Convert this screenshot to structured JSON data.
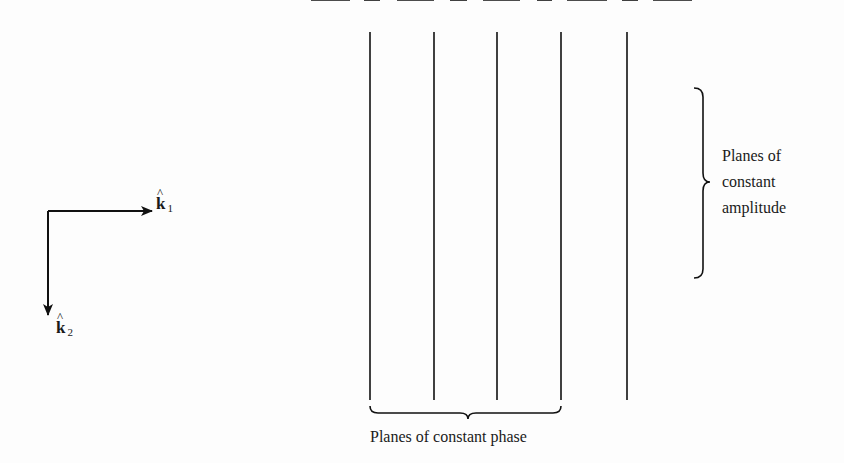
{
  "diagram": {
    "type": "wave-planes",
    "colors": {
      "ink": "#111111",
      "background": "#fdfdfd"
    },
    "unit_vectors": [
      {
        "id": "k1",
        "symbol": "k",
        "hat": "^",
        "subscript": "1",
        "direction": "right"
      },
      {
        "id": "k2",
        "symbol": "k",
        "hat": "^",
        "subscript": "2",
        "direction": "down"
      }
    ],
    "grid": {
      "vertical_lines": 5,
      "horizontal_dashed_rows": 5
    },
    "labels": {
      "amplitude_line1": "Planes of",
      "amplitude_line2": "constant",
      "amplitude_line3": "amplitude",
      "phase": "Planes of constant phase"
    }
  }
}
